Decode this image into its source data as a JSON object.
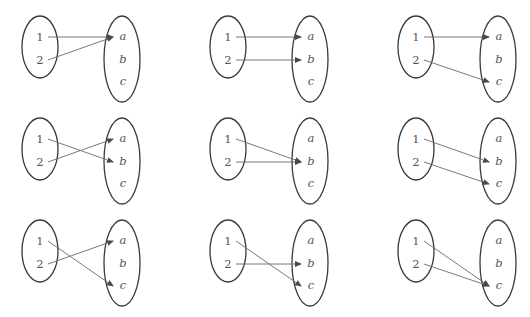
{
  "diagram": {
    "type": "function-mappings-grid",
    "rows": 3,
    "cols": 3,
    "domain_set": [
      "1",
      "2"
    ],
    "codomain_set": [
      "a",
      "b",
      "c"
    ],
    "colors": {
      "ellipse_stroke": "#3a3a3a",
      "arrow": "#6a6a6a",
      "label": "#555555"
    },
    "panels": [
      {
        "row": 0,
        "col": 0,
        "mapping": {
          "1": "a",
          "2": "a"
        }
      },
      {
        "row": 0,
        "col": 1,
        "mapping": {
          "1": "a",
          "2": "b"
        }
      },
      {
        "row": 0,
        "col": 2,
        "mapping": {
          "1": "a",
          "2": "c"
        }
      },
      {
        "row": 1,
        "col": 0,
        "mapping": {
          "1": "b",
          "2": "a"
        }
      },
      {
        "row": 1,
        "col": 1,
        "mapping": {
          "1": "b",
          "2": "b"
        }
      },
      {
        "row": 1,
        "col": 2,
        "mapping": {
          "1": "b",
          "2": "c"
        }
      },
      {
        "row": 2,
        "col": 0,
        "mapping": {
          "1": "c",
          "2": "a"
        }
      },
      {
        "row": 2,
        "col": 1,
        "mapping": {
          "1": "c",
          "2": "b"
        }
      },
      {
        "row": 2,
        "col": 2,
        "mapping": {
          "1": "c",
          "2": "c"
        }
      }
    ]
  }
}
